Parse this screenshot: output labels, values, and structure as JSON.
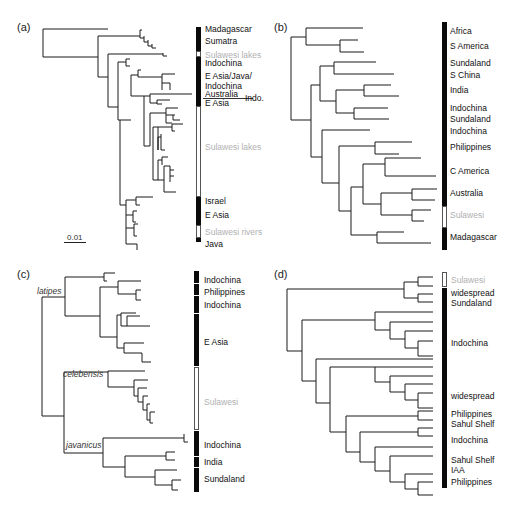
{
  "figure": {
    "panels": [
      {
        "id": "a",
        "label": "(a)",
        "regions": [
          {
            "name": "Madagascar",
            "top": 27,
            "height": 5,
            "style": "dark",
            "label_y": 29
          },
          {
            "name": "Sumatra",
            "top": 32,
            "height": 19,
            "style": "dark",
            "label_y": 41
          },
          {
            "name": "Sulawesi lakes",
            "top": 51,
            "height": 6,
            "style": "light",
            "label_y": 56
          },
          {
            "name": "Indochina",
            "top": 57,
            "height": 12,
            "style": "dark",
            "label_y": 63
          },
          {
            "name": "E Asia/Java/",
            "top": 69,
            "height": 25,
            "style": "dark",
            "label_y": 76
          },
          {
            "name": "Indochina",
            "top": 69,
            "height": 0,
            "style": "none",
            "label_y": 86
          },
          {
            "name": "Australia",
            "top": 94,
            "height": 4,
            "style": "dark",
            "label_y": 94
          },
          {
            "name": "E Asia",
            "top": 98,
            "height": 8,
            "style": "dark",
            "label_y": 103
          },
          {
            "name": "Sulawesi lakes",
            "top": 106,
            "height": 71,
            "style": "light",
            "label_y": 147
          },
          {
            "name": "Israel",
            "top": 197,
            "height": 8,
            "style": "dark",
            "label_y": 201
          },
          {
            "name": "E Asia",
            "top": 205,
            "height": 20,
            "style": "dark",
            "label_y": 215
          },
          {
            "name": "Sulawesi rivers",
            "top": 225,
            "height": 13,
            "style": "light",
            "label_y": 232
          },
          {
            "name": "Java",
            "top": 238,
            "height": 4,
            "style": "dark",
            "label_y": 244
          }
        ],
        "annotation": "Indo.",
        "scale_bar": {
          "label": "0.01",
          "length_px": 22
        }
      },
      {
        "id": "b",
        "label": "(b)",
        "regions": [
          {
            "name": "Africa",
            "top": 22,
            "height": 12,
            "style": "dark",
            "label_y": 31
          },
          {
            "name": "S America",
            "top": 35,
            "height": 22,
            "style": "dark",
            "label_y": 46
          },
          {
            "name": "Sundaland",
            "top": 58,
            "height": 12,
            "style": "dark",
            "label_y": 63
          },
          {
            "name": "S China",
            "top": 70,
            "height": 11,
            "style": "dark",
            "label_y": 75
          },
          {
            "name": "India",
            "top": 81,
            "height": 23,
            "style": "dark",
            "label_y": 90
          },
          {
            "name": "Indochina",
            "top": 104,
            "height": 11,
            "style": "dark",
            "label_y": 108
          },
          {
            "name": "Sundaland",
            "top": 115,
            "height": 12,
            "style": "dark",
            "label_y": 119
          },
          {
            "name": "Indochina",
            "top": 127,
            "height": 11,
            "style": "dark",
            "label_y": 131
          },
          {
            "name": "Philippines",
            "top": 138,
            "height": 23,
            "style": "dark",
            "label_y": 147
          },
          {
            "name": "C America",
            "top": 161,
            "height": 23,
            "style": "dark",
            "label_y": 171
          },
          {
            "name": "Australia",
            "top": 184,
            "height": 22,
            "style": "dark",
            "label_y": 193
          },
          {
            "name": "Sulawesi",
            "top": 206,
            "height": 22,
            "style": "light",
            "label_y": 215
          },
          {
            "name": "Madagascar",
            "top": 228,
            "height": 22,
            "style": "dark",
            "label_y": 237
          }
        ]
      },
      {
        "id": "c",
        "label": "(c)",
        "regions": [
          {
            "name": "Indochina",
            "top": 271,
            "height": 11,
            "style": "dark",
            "label_y": 280
          },
          {
            "name": "Philippines",
            "top": 283,
            "height": 11,
            "style": "dark",
            "label_y": 292
          },
          {
            "name": "Indochina",
            "top": 295,
            "height": 17,
            "style": "dark",
            "label_y": 305
          },
          {
            "name": "E Asia",
            "top": 313,
            "height": 52,
            "style": "dark",
            "label_y": 342
          },
          {
            "name": "Sulawesi",
            "top": 366,
            "height": 63,
            "style": "light",
            "label_y": 402
          },
          {
            "name": "Indochina",
            "top": 430,
            "height": 25,
            "style": "dark",
            "label_y": 444
          },
          {
            "name": "India",
            "top": 456,
            "height": 10,
            "style": "dark",
            "label_y": 462
          },
          {
            "name": "Sundaland",
            "top": 467,
            "height": 24,
            "style": "dark",
            "label_y": 479
          }
        ],
        "clades": [
          {
            "name": "latipes",
            "x": 30,
            "y": 290
          },
          {
            "name": "celebensis",
            "x": 63,
            "y": 373
          },
          {
            "name": "javanicus",
            "x": 66,
            "y": 443
          }
        ]
      },
      {
        "id": "d",
        "label": "(d)",
        "regions": [
          {
            "name": "Sulawesi",
            "top": 272,
            "height": 15,
            "style": "light",
            "label_y": 280
          },
          {
            "name": "widespread",
            "top": 288,
            "height": 9,
            "style": "dark",
            "label_y": 294
          },
          {
            "name": "Sundaland",
            "top": 297,
            "height": 10,
            "style": "dark",
            "label_y": 304
          },
          {
            "name": "Indochina",
            "top": 307,
            "height": 75,
            "style": "dark",
            "label_y": 343
          },
          {
            "name": "widespread",
            "top": 382,
            "height": 27,
            "style": "dark",
            "label_y": 397
          },
          {
            "name": "Philippines",
            "top": 409,
            "height": 9,
            "style": "dark",
            "label_y": 415
          },
          {
            "name": "Sahul Shelf",
            "top": 418,
            "height": 10,
            "style": "dark",
            "label_y": 424
          },
          {
            "name": "Indochina",
            "top": 428,
            "height": 20,
            "style": "dark",
            "label_y": 441
          },
          {
            "name": "Sahul Shelf",
            "top": 456,
            "height": 8,
            "style": "dark",
            "label_y": 460
          },
          {
            "name": "IAA",
            "top": 464,
            "height": 8,
            "style": "dark",
            "label_y": 470
          },
          {
            "name": "Philippines",
            "top": 472,
            "height": 16,
            "style": "dark",
            "label_y": 482
          }
        ]
      }
    ]
  },
  "colors": {
    "dark_region": "#0a0a0a",
    "light_region_text": "#b0b0b0",
    "branch": "#1a1a1a"
  }
}
